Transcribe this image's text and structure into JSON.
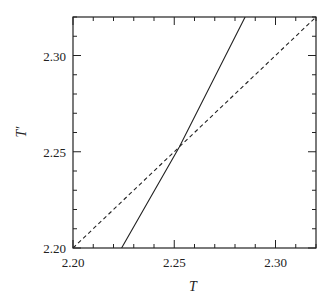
{
  "chart_data": {
    "type": "line",
    "title": "",
    "xlabel": "T",
    "ylabel": "T′",
    "xlim": [
      2.2,
      2.32
    ],
    "ylim": [
      2.2,
      2.32
    ],
    "grid": false,
    "legend": null,
    "x_ticks": {
      "major": [
        2.2,
        2.25,
        2.3
      ],
      "major_labels": [
        "2.20",
        "2.25",
        "2.30"
      ],
      "minor_step": 0.01
    },
    "y_ticks": {
      "major": [
        2.2,
        2.25,
        2.3
      ],
      "major_labels": [
        "2.20",
        "2.25",
        "2.30"
      ],
      "minor_step": 0.01
    },
    "series": [
      {
        "name": "T′(T) map",
        "style": "solid",
        "color": "#222222",
        "x": [
          2.224,
          2.2525,
          2.285
        ],
        "y": [
          2.2,
          2.2525,
          2.32
        ]
      },
      {
        "name": "T′ = T (identity)",
        "style": "dashed",
        "color": "#222222",
        "x": [
          2.2,
          2.32
        ],
        "y": [
          2.2,
          2.32
        ]
      }
    ],
    "annotations": [
      {
        "type": "intersection",
        "x": 2.2525,
        "y": 2.2525
      }
    ]
  },
  "axes": {
    "x_label": "T",
    "y_label": "T′",
    "x_tick_labels": [
      "2.20",
      "2.25",
      "2.30"
    ],
    "y_tick_labels": [
      "2.20",
      "2.25",
      "2.30"
    ]
  }
}
